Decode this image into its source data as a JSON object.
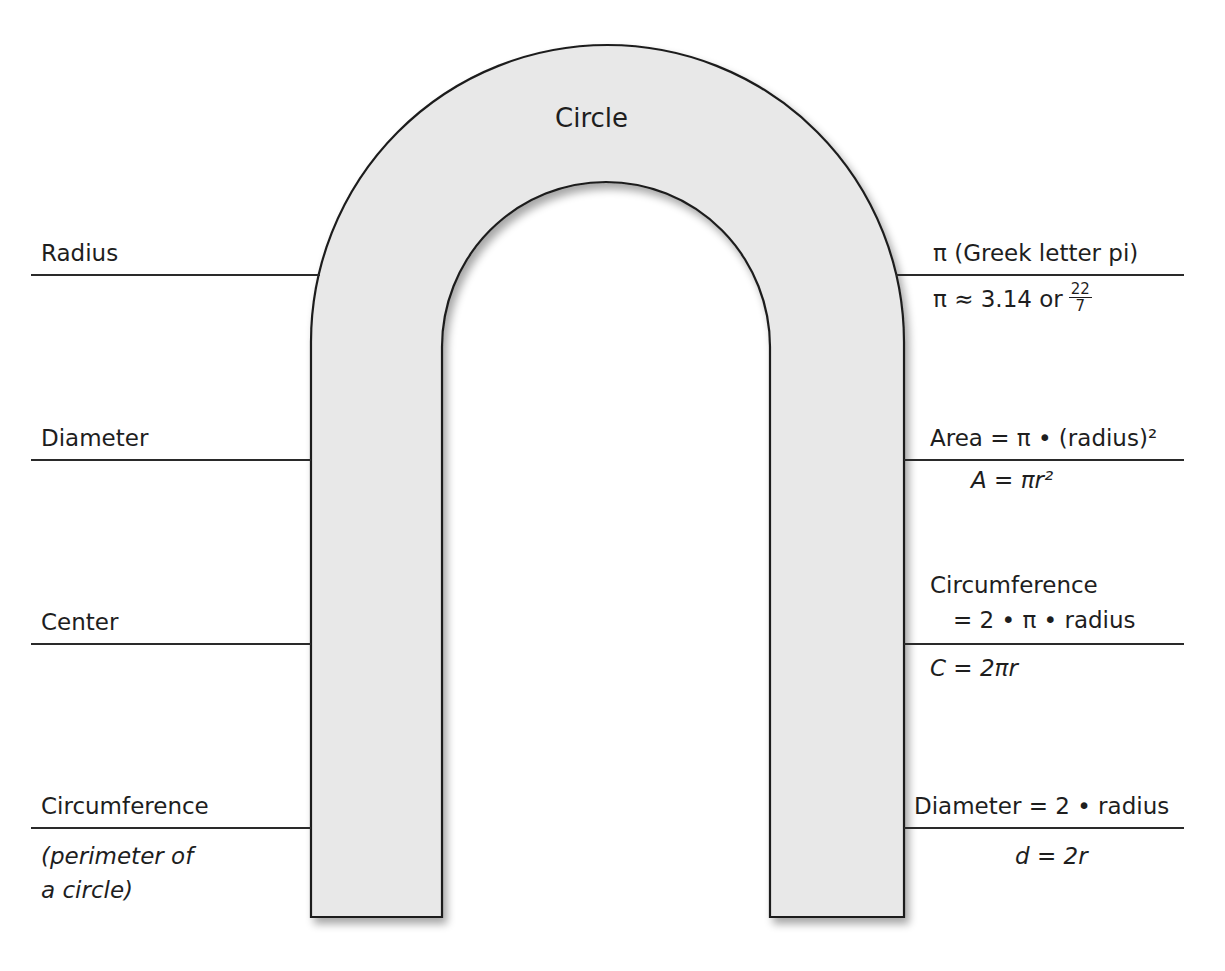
{
  "diagram": {
    "title": "Circle",
    "shape": "arch",
    "colors": {
      "arch_fill": "#e8e8e8",
      "stroke": "#1e1e1e",
      "text": "#1e1e1e",
      "background": "#ffffff"
    }
  },
  "left_terms": [
    {
      "label": "Radius"
    },
    {
      "label": "Diameter"
    },
    {
      "label": "Center"
    },
    {
      "label": "Circumference",
      "note_line1": "(perimeter of",
      "note_line2": "a circle)"
    }
  ],
  "right_definitions": [
    {
      "top": "π  (Greek letter pi)",
      "bottom_prefix": "π ≈ 3.14 or",
      "frac_num": "22",
      "frac_den": "7"
    },
    {
      "top": "Area = π • (radius)²",
      "bottom": "A = πr²"
    },
    {
      "top_line1": "Circumference",
      "top_line2": "= 2 • π • radius",
      "bottom": "C = 2πr"
    },
    {
      "top": "Diameter = 2 • radius",
      "bottom": "d = 2r"
    }
  ]
}
